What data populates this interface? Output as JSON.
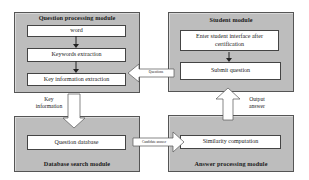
{
  "diagram": {
    "modules": {
      "question_processing": {
        "title": "Question processing module",
        "steps": [
          "word",
          "Keywords extraction",
          "Key information extraction"
        ]
      },
      "student": {
        "title": "Student module",
        "steps": [
          "Enter student interface after certification",
          "Submit question"
        ]
      },
      "database_search": {
        "title": "Database search module",
        "steps": [
          "Question database"
        ]
      },
      "answer_processing": {
        "title": "Answer processing module",
        "steps": [
          "Similarity computation"
        ]
      }
    },
    "connections": {
      "questions": "Questions",
      "key_information": "Key information",
      "candidate_answer": "Candidate answer",
      "output_answer": "Output answer"
    },
    "colors": {
      "module_fill": "#bdbdbd",
      "step_fill": "#ffffff",
      "border": "#444444"
    }
  }
}
